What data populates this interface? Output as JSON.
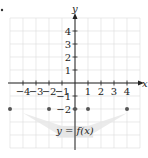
{
  "chart_data": {
    "type": "scatter",
    "title": "",
    "xlabel": "x",
    "ylabel": "y",
    "xlim": [
      -5,
      5
    ],
    "ylim": [
      -5,
      5
    ],
    "grid": true,
    "x_ticks": [
      -4,
      -3,
      -2,
      -1,
      1,
      2,
      3,
      4
    ],
    "y_ticks": [
      4,
      3,
      2,
      1,
      -1,
      -2
    ],
    "series": [
      {
        "name": "y = f(x)",
        "points": [
          {
            "x": -5,
            "y": -2
          },
          {
            "x": -2,
            "y": -2
          },
          {
            "x": 0,
            "y": -2
          },
          {
            "x": 1,
            "y": -2
          },
          {
            "x": 4,
            "y": -2
          }
        ]
      }
    ],
    "annotations": [
      {
        "text": "y = f(x)",
        "x": 0,
        "y": -3.5
      }
    ]
  },
  "labels": {
    "x_axis": "x",
    "y_axis": "y",
    "function": "y = f(x)"
  },
  "colors": {
    "grid": "#dcdcdc",
    "axis": "#222222",
    "dot": "#555555",
    "label_shade": "#e6e6e6"
  }
}
